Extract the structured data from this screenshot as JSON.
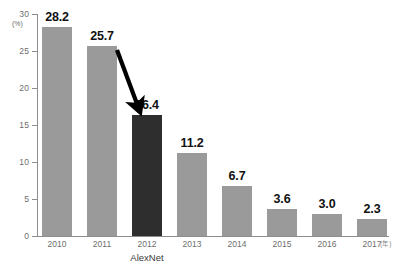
{
  "chart_data": {
    "type": "bar",
    "title": "",
    "subtitle": "",
    "xlabel": "(年)",
    "ylabel": "(%)",
    "categories": [
      "2010",
      "2011",
      "2012",
      "2013",
      "2014",
      "2015",
      "2016",
      "2017"
    ],
    "values": [
      28.2,
      25.7,
      16.4,
      11.2,
      6.7,
      3.6,
      3.0,
      2.3
    ],
    "value_labels": [
      "28.2",
      "25.7",
      "16.4",
      "11.2",
      "6.7",
      "3.6",
      "3.0",
      "2.3"
    ],
    "ylim": [
      0,
      30
    ],
    "y_ticks": [
      0,
      5,
      10,
      15,
      20,
      25,
      30
    ],
    "y_tick_labels": [
      "0",
      "5",
      "10",
      "15",
      "20",
      "25",
      "30"
    ],
    "grid": false,
    "legend": "none",
    "bar_colors": [
      "#9a9a9a",
      "#9a9a9a",
      "#2e2e2e",
      "#9a9a9a",
      "#9a9a9a",
      "#9a9a9a",
      "#9a9a9a",
      "#9a9a9a"
    ],
    "highlight_category": "2012",
    "highlight_color": "#2e2e2e",
    "default_bar_color": "#9a9a9a",
    "annotations": [
      {
        "name": "alexnet-label",
        "text": "AlexNet",
        "attached_to": "2012"
      },
      {
        "name": "highlight-arrow",
        "text": "",
        "from": [
          117,
          50
        ],
        "to": [
          140,
          112
        ],
        "color": "#000000"
      }
    ],
    "axis_color": "#8d8d8d",
    "tick_label_color": "#6e6e6e",
    "value_label_color": "#111111"
  },
  "axes_geometry": {
    "baseline_y": 236,
    "top_y": 14,
    "plot_left_x": 37,
    "plot_right_x": 389,
    "bar_width": 30,
    "bar_pitch": 45,
    "first_bar_left": 42
  }
}
